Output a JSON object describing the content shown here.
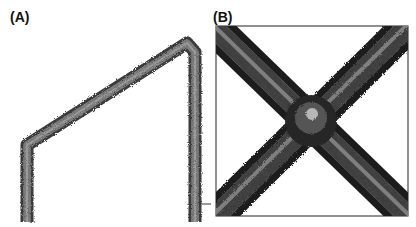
{
  "figure": {
    "panels": [
      {
        "label": "(A)",
        "description": "Micrograph of a bent filament forming an inverted-V / frame shape"
      },
      {
        "label": "(B)",
        "description": "Micrograph of two crossing filaments forming an X with a bead at the junction"
      }
    ],
    "colors": {
      "background": "#ffffff",
      "filament_dark": "#2a2a2a",
      "filament_mid": "#6b6b6b",
      "filament_light": "#b5b5b5",
      "frame": "#222222"
    }
  }
}
